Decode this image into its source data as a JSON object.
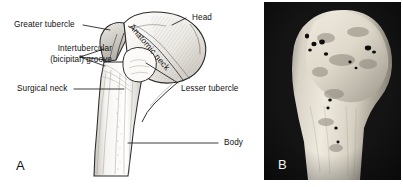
{
  "figure": {
    "panels": [
      {
        "id": "A",
        "letter": "A",
        "type": "line-drawing",
        "description": "Anterior view line drawing of the proximal humerus",
        "labels": [
          {
            "key": "greater_tubercle",
            "text": "Greater tubercle"
          },
          {
            "key": "intertubercular_l1",
            "text": "Intertubercular"
          },
          {
            "key": "intertubercular_l2",
            "text": "(bicipital) groove"
          },
          {
            "key": "surgical_neck",
            "text": "Surgical neck"
          },
          {
            "key": "head",
            "text": "Head"
          },
          {
            "key": "anatomic_neck",
            "text": "Anatomic neck"
          },
          {
            "key": "lesser_tubercle",
            "text": "Lesser tubercle"
          },
          {
            "key": "body",
            "text": "Body"
          }
        ]
      },
      {
        "id": "B",
        "letter": "B",
        "type": "photograph",
        "description": "Photograph of a dried humerus bone specimen, anterior view"
      }
    ]
  },
  "colors": {
    "background": "#ffffff",
    "ink": "#111111",
    "leader_line": "#1a1a1a",
    "bone_fill": "#f4f2ee",
    "bone_shade": "#b9b4ad",
    "photo_background": "#141414",
    "photo_bone": "#cdc7bb",
    "photo_letter": "#f2f2f2"
  }
}
